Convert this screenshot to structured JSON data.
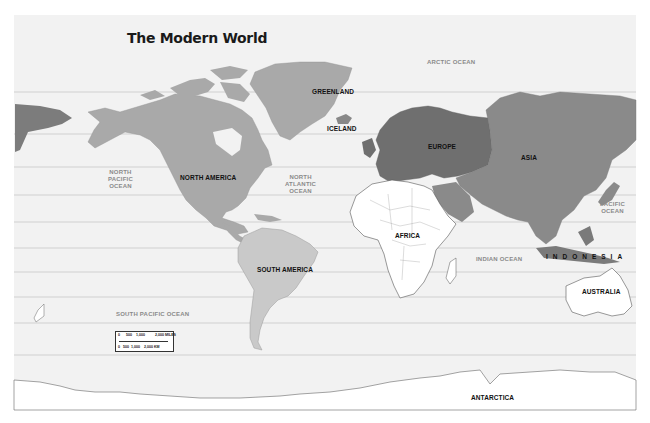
{
  "title": "The Modern World",
  "continents": {
    "north_america": "NORTH AMERICA",
    "south_america": "SOUTH AMERICA",
    "europe": "EUROPE",
    "asia": "ASIA",
    "africa": "AFRICA",
    "australia": "AUSTRALIA",
    "antarctica": "ANTARCTICA"
  },
  "places": {
    "greenland": "GREENLAND",
    "iceland": "ICELAND",
    "indonesia": "INDONESIA"
  },
  "oceans": {
    "arctic": "ARCTIC OCEAN",
    "north_pacific": "NORTH\nPACIFIC\nOCEAN",
    "north_atlantic": "NORTH\nATLANTIC\nOCEAN",
    "pacific": "PACIFIC\nOCEAN",
    "indian": "INDIAN OCEAN",
    "south_pacific": "SOUTH PACIFIC OCEAN"
  },
  "scale": {
    "miles_ticks": [
      "0",
      "500",
      "1,000",
      "2,000 MILES"
    ],
    "km_ticks": [
      "0",
      "500",
      "1,000",
      "2,000 KM"
    ]
  },
  "colors": {
    "background": "#f2f2f2",
    "gridline": "#c8c8c8",
    "north_south_america": "#a9a9a9",
    "south_america": "#c9c9c9",
    "europe": "#6f6f6f",
    "asia": "#8a8a8a",
    "africa": "#ffffff",
    "australia": "#ffffff"
  },
  "gridlines_y": [
    92,
    134,
    167,
    195,
    222,
    248,
    272,
    297,
    323,
    355
  ]
}
